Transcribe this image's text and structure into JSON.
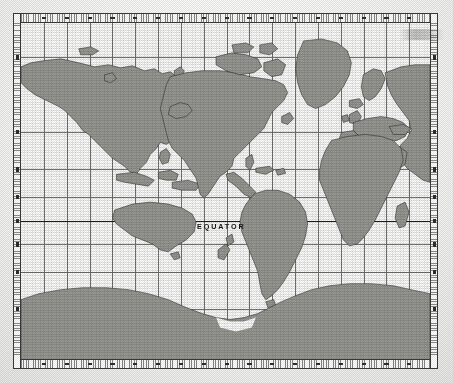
{
  "map": {
    "title": "World Map - Mercator Projection",
    "projection": "Mercator",
    "center_longitude": -100,
    "equator_label": "EQUATOR",
    "frame": {
      "outer_border_color": "#3a3a38",
      "ruler_band_color": "#ffffff",
      "tick_color": "#2e2e2c"
    },
    "graticule": {
      "visible": true,
      "line_color": "#6e6e6b",
      "equator_line_color": "#1d1d1b",
      "meridian_interval_degrees": 20,
      "parallel_interval_degrees": 20,
      "meridian_count": 17,
      "parallel_count": 9
    },
    "land": {
      "fill_color": "#9a9a96",
      "outline_color": "#2b2b29",
      "regions": [
        "Asia",
        "Europe",
        "Africa",
        "North America",
        "South America",
        "Greenland",
        "Australia",
        "New Zealand",
        "Antarctica",
        "Japan",
        "Indonesia",
        "Madagascar",
        "Iceland",
        "British Isles",
        "Canadian Arctic Archipelago"
      ]
    },
    "ocean": {
      "fill_color": "#ffffff"
    },
    "longitude_ticks": [
      "160E",
      "180",
      "160W",
      "140W",
      "120W",
      "100W",
      "80W",
      "60W",
      "40W",
      "20W",
      "0",
      "20E",
      "40E",
      "60E",
      "80E",
      "100E",
      "120E",
      "140E",
      "160E"
    ],
    "latitude_ticks": [
      "80N",
      "60N",
      "40N",
      "20N",
      "0",
      "20S",
      "40S",
      "60S",
      "80S"
    ]
  },
  "canvas": {
    "width": 453,
    "height": 383,
    "background": "#fdfdfc"
  }
}
